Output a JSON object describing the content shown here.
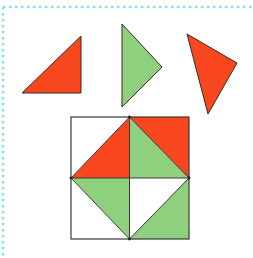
{
  "colors": {
    "red": "#F8461F",
    "green": "#8ED07E",
    "white": "#FFFFFF",
    "outline": "#3a2a22",
    "border": "#7FE3EE"
  },
  "loose_pieces": [
    {
      "id": "piece-1",
      "color": "red",
      "points": "22,93 81,36 81,93"
    },
    {
      "id": "piece-2",
      "color": "green",
      "points": "122,24 162,67 122,107"
    },
    {
      "id": "piece-3",
      "color": "red",
      "points": "187,34 237,63 208,114"
    }
  ],
  "grid": {
    "x": 71,
    "y": 117,
    "size": 118,
    "cells": [
      {
        "id": "tl-white",
        "color": "white",
        "points": "71,117 129.5,117 71,178"
      },
      {
        "id": "tl-red",
        "color": "red",
        "points": "129.5,117 129.5,178 71,178"
      },
      {
        "id": "tr-green",
        "color": "green",
        "points": "129.5,117 189,178 129.5,178"
      },
      {
        "id": "tr-red",
        "color": "red",
        "points": "129.5,117 189,117 189,178"
      },
      {
        "id": "bl-green",
        "color": "green",
        "points": "71,178 129.5,178 129.5,239"
      },
      {
        "id": "bl-white",
        "color": "white",
        "points": "71,178 129.5,239 71,239"
      },
      {
        "id": "br-white",
        "color": "white",
        "points": "129.5,178 189,178 129.5,239"
      },
      {
        "id": "br-green",
        "color": "green",
        "points": "189,178 189,239 129.5,239"
      }
    ]
  }
}
